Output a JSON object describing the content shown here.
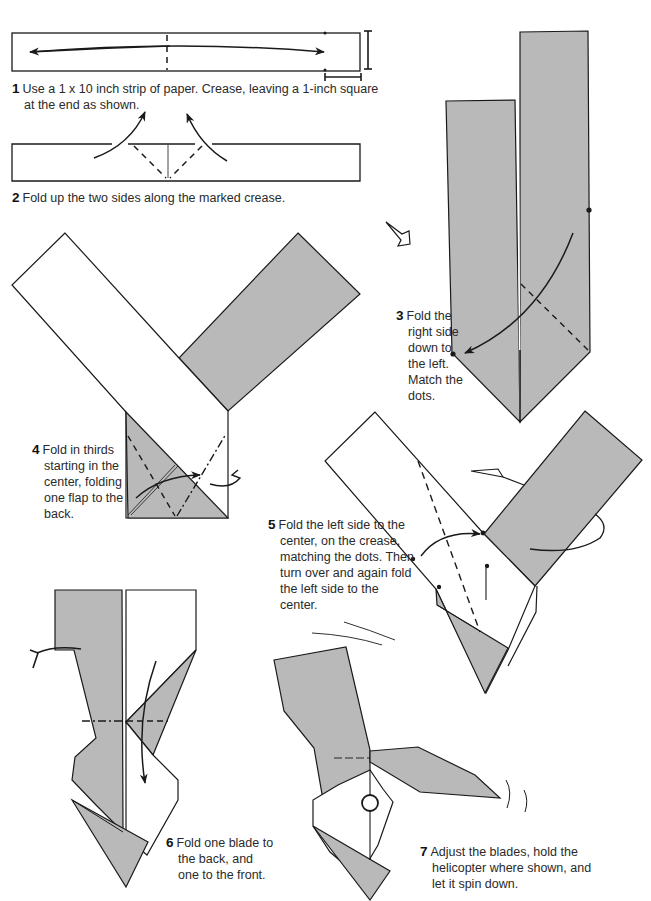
{
  "colors": {
    "paper_gray": "#b9b9b9",
    "paper_white": "#ffffff",
    "line": "#1a1a1a",
    "text": "#2a2a2a"
  },
  "steps": [
    {
      "number": "1",
      "text": "Use a 1 x 10 inch strip of paper. Crease, leaving a 1-inch square at the end as shown."
    },
    {
      "number": "2",
      "text": "Fold up the two sides along the marked crease."
    },
    {
      "number": "3",
      "text": "Fold the right side down to the left. Match the dots."
    },
    {
      "number": "4",
      "text": "Fold in thirds starting in the center, folding one flap to the back."
    },
    {
      "number": "5",
      "text": "Fold the left side to the center, on the crease, matching the dots. Then turn over and again fold the left side to the center."
    },
    {
      "number": "6",
      "text": "Fold one blade to the back, and one to the front."
    },
    {
      "number": "7",
      "text": "Adjust the blades, hold the helicopter where shown, and let it spin down."
    }
  ],
  "icons": [
    "valley-fold-dashed-line",
    "mountain-fold-dash-dot-line",
    "fold-arrow",
    "turn-over-arrow-icon",
    "rotate-view-arrow-icon",
    "match-dot",
    "hold-point-circle",
    "spin-motion-lines"
  ]
}
